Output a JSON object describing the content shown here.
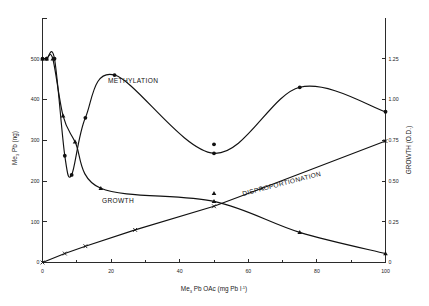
{
  "chart_data": {
    "type": "line",
    "title": "",
    "xlabel": "Me3 Pb OAc  (mg Pb l-1)",
    "xlabel_parts": {
      "pre": "Me",
      "sub1": "3",
      "mid": " Pb OAc  (mg Pb l",
      "sup1": "-1",
      "post": ")"
    },
    "ylabel_left_parts": {
      "pre": "Me",
      "sub1": "3",
      "mid": " Pb  (ng)"
    },
    "ylabel_right": "GROWTH  (O.D.)",
    "xlim": [
      0,
      100
    ],
    "xticks": [
      0,
      20,
      40,
      60,
      80,
      100
    ],
    "xticklabels": [
      "0",
      "20",
      "40",
      "60",
      "80",
      "100"
    ],
    "xminorticks": [
      10,
      30,
      50,
      70,
      90
    ],
    "ylim_left": [
      0,
      600
    ],
    "yticks_left": [
      0,
      100,
      200,
      300,
      400,
      500
    ],
    "yticklabels_left": [
      "0",
      "100",
      "200",
      "300",
      "400",
      "500"
    ],
    "ylim_right": [
      0,
      1.5
    ],
    "yticks_right": [
      0,
      0.25,
      0.5,
      0.75,
      1.0,
      1.25
    ],
    "yticklabels_right": [
      "0",
      "0.25",
      "0.50",
      "0.75",
      "1.00",
      "1.25"
    ],
    "grid": false,
    "legend": "inline-curve-labels",
    "series": [
      {
        "name": "METHYLATION",
        "axis": "left",
        "marker": "filled-circle",
        "label": "METHYLATION",
        "label_x": 26,
        "label_y": 512,
        "points": [
          {
            "x": 0,
            "y": 500
          },
          {
            "x": 1.2,
            "y": 500
          },
          {
            "x": 3.5,
            "y": 500
          },
          {
            "x": 6.5,
            "y": 262
          },
          {
            "x": 8.5,
            "y": 215
          },
          {
            "x": 12.5,
            "y": 355
          },
          {
            "x": 21,
            "y": 460
          },
          {
            "x": 50,
            "y": 268
          },
          {
            "x": 75,
            "y": 430
          },
          {
            "x": 100,
            "y": 370
          }
        ]
      },
      {
        "name": "GROWTH",
        "axis": "right",
        "marker": "filled-triangle",
        "label": "GROWTH",
        "label_x": 17,
        "label_y": 0.47,
        "points": [
          {
            "x": 0,
            "y": 1.25
          },
          {
            "x": 1.2,
            "y": 1.25
          },
          {
            "x": 3.0,
            "y": 1.25
          },
          {
            "x": 6.0,
            "y": 0.9
          },
          {
            "x": 9.5,
            "y": 0.74
          },
          {
            "x": 17,
            "y": 0.455
          },
          {
            "x": 50,
            "y": 0.375
          },
          {
            "x": 75,
            "y": 0.185
          },
          {
            "x": 100,
            "y": 0.055
          }
        ]
      },
      {
        "name": "DISPROPORTIONATION",
        "axis": "right",
        "marker": "cross-x",
        "label": "DISPROPORTIONATION",
        "label_x": 60,
        "label_y": 0.47,
        "points": [
          {
            "x": 0,
            "y": 0.0
          },
          {
            "x": 6.5,
            "y": 0.055
          },
          {
            "x": 12.5,
            "y": 0.1
          },
          {
            "x": 27,
            "y": 0.2
          },
          {
            "x": 50,
            "y": 0.345
          },
          {
            "x": 64,
            "y": 0.455
          },
          {
            "x": 100,
            "y": 0.745
          }
        ]
      }
    ],
    "extra_markers": [
      {
        "x": 50,
        "y_left": 290,
        "marker": "filled-circle",
        "axis": "left"
      },
      {
        "x": 50,
        "y_right": 0.425,
        "marker": "filled-triangle",
        "axis": "right"
      }
    ]
  },
  "figure": {
    "background_color": "#ffffff",
    "axis_color": "#2b2b2b",
    "curve_color": "#111111"
  }
}
